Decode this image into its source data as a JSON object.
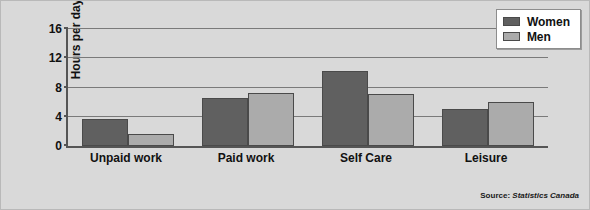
{
  "chart_data": {
    "type": "bar",
    "title": "",
    "subtitle": "",
    "xlabel": "",
    "ylabel": "Hours per day",
    "ylim": [
      0,
      16
    ],
    "yticks": [
      0,
      4,
      8,
      12,
      16
    ],
    "ytick_labels": [
      "0",
      "4",
      "8",
      "12",
      "16"
    ],
    "grid": true,
    "legend_position": "top-right",
    "categories": [
      "Unpaid work",
      "Paid work",
      "Self Care",
      "Leisure"
    ],
    "series": [
      {
        "name": "Women",
        "color": "#606060",
        "values": [
          3.7,
          6.5,
          10.3,
          5.1
        ]
      },
      {
        "name": "Men",
        "color": "#ababab",
        "values": [
          1.6,
          7.3,
          7.1,
          6.0
        ]
      }
    ],
    "annotations": [
      "Source: Statistics Canada"
    ]
  },
  "legend": {
    "items": [
      {
        "label": "Women",
        "swatch": "women"
      },
      {
        "label": "Men",
        "swatch": "men"
      }
    ]
  },
  "source": {
    "prefix": "Source:",
    "name": "Statistics Canada"
  },
  "colors": {
    "background": "#d9d9d9",
    "axis": "#555555",
    "gridline": "#7a7a7a",
    "women": "#606060",
    "men": "#ababab",
    "text": "#111111"
  }
}
